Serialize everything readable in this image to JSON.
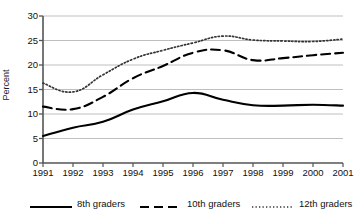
{
  "chart_data": {
    "type": "line",
    "title": "",
    "xlabel": "",
    "ylabel": "Percent",
    "ylim": [
      0,
      30
    ],
    "yticks": [
      0,
      5,
      10,
      15,
      20,
      25,
      30
    ],
    "ytick_labels": [
      "0",
      "5",
      "10",
      "15",
      "20",
      "25",
      "30"
    ],
    "grid": true,
    "legend_position": "bottom",
    "categories": [
      "1991",
      "1992",
      "1993",
      "1994",
      "1995",
      "1996",
      "1997",
      "1998",
      "1999",
      "2000",
      "2001"
    ],
    "x": [
      1991,
      1992,
      1993,
      1994,
      1995,
      1996,
      1997,
      1998,
      1999,
      2000,
      2001
    ],
    "series": [
      {
        "name": "8th graders",
        "style": "solid",
        "color": "#000000",
        "values": [
          5.5,
          7.2,
          8.4,
          10.9,
          12.6,
          14.3,
          12.9,
          11.8,
          11.7,
          11.9,
          11.7
        ]
      },
      {
        "name": "10th graders",
        "style": "dashed",
        "color": "#000000",
        "values": [
          11.5,
          11.0,
          13.5,
          17.3,
          19.8,
          22.5,
          23.0,
          21.0,
          21.4,
          22.0,
          22.5
        ]
      },
      {
        "name": "12th graders",
        "style": "dotted",
        "color": "#333333",
        "values": [
          16.3,
          14.5,
          18.0,
          21.2,
          23.0,
          24.5,
          25.9,
          25.1,
          24.9,
          24.8,
          25.3
        ]
      }
    ]
  },
  "legend": {
    "items": [
      {
        "label": "8th graders"
      },
      {
        "label": "10th graders"
      },
      {
        "label": "12th graders"
      }
    ]
  },
  "axis": {
    "y_title": "Percent"
  },
  "colors": {
    "gridline": "#b8b8b8",
    "axis": "#555555",
    "text": "#111111",
    "series_solid": "#000000",
    "series_dashed": "#000000",
    "series_dotted": "#333333"
  }
}
